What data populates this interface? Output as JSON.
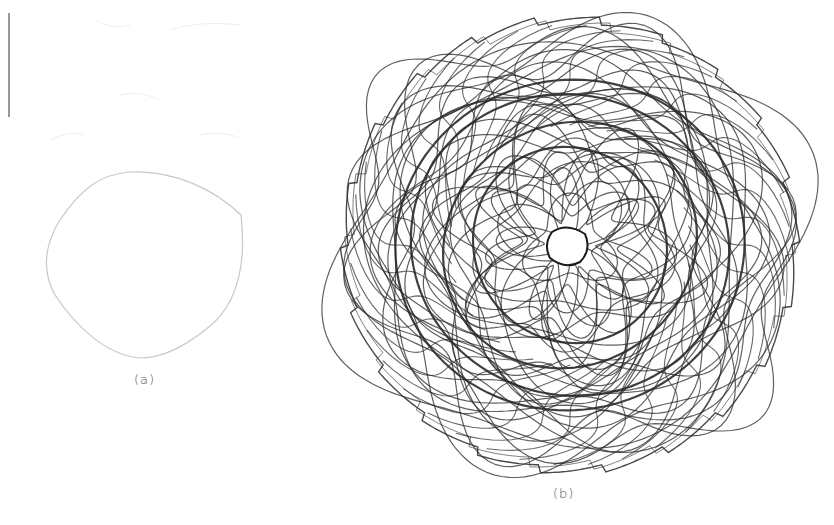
{
  "figure": {
    "panels": [
      {
        "id": "a",
        "caption": "(a)",
        "description": "single closed rounded loop trajectory",
        "stroke_color": "#c8c8c8"
      },
      {
        "id": "b",
        "caption": "(b)",
        "description": "dense chaotic rosette trajectory with sawtooth outer boundary",
        "stroke_color": "#2a2a2a"
      }
    ],
    "margin_line_color": "#9a9a9a"
  }
}
